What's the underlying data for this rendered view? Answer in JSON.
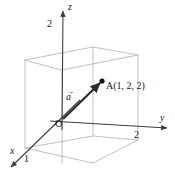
{
  "figure": {
    "colors": {
      "axis": "#3b3b3b",
      "box": "#b9b9b9",
      "vector": "#2e2e2e",
      "point": "#111111",
      "text": "#1a1a1a",
      "background": "#ffffff"
    },
    "axes": [
      {
        "name": "x-axis",
        "label": "x",
        "label_x": 10,
        "label_y": 147,
        "tick_label": "1",
        "tick_x": 24,
        "tick_y": 155
      },
      {
        "name": "y-axis",
        "label": "y",
        "label_x": 160,
        "label_y": 114,
        "tick_label": "2",
        "tick_x": 134,
        "tick_y": 131
      },
      {
        "name": "z-axis",
        "label": "z",
        "label_x": 68,
        "label_y": 3,
        "tick_label": "2",
        "tick_x": 47,
        "tick_y": 20
      }
    ],
    "origin": {
      "label": "O",
      "x": 55,
      "y": 120
    },
    "vector": {
      "label": "a",
      "accent": "→",
      "x": 68,
      "y": 93
    },
    "point": {
      "name": "A",
      "label": "A(1,  2,  2)",
      "label_x": 106,
      "label_y": 82,
      "dot_x": 102,
      "dot_y": 81,
      "coordinates": [
        1,
        2,
        2
      ]
    }
  }
}
